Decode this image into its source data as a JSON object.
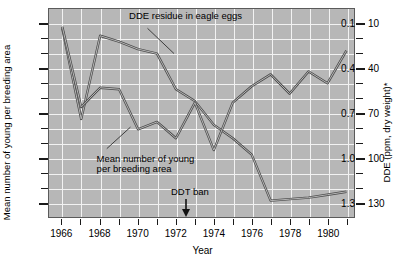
{
  "chart_data": {
    "type": "line",
    "title": "",
    "xlabel": "Year",
    "ylabel_left": "Mean number of young per breeding area",
    "ylabel_right": "DDE (ppm, dry weight)*",
    "x": [
      1966,
      1967,
      1968,
      1969,
      1970,
      1971,
      1972,
      1973,
      1974,
      1975,
      1976,
      1977,
      1978,
      1979,
      1980,
      1981
    ],
    "xlim": [
      1965.3,
      1981.4
    ],
    "xticks_major": [
      1966,
      1968,
      1970,
      1972,
      1974,
      1976,
      1978,
      1980
    ],
    "xticks_all": [
      1966,
      1967,
      1968,
      1969,
      1970,
      1971,
      1972,
      1973,
      1974,
      1975,
      1976,
      1977,
      1978,
      1979,
      1980,
      1981
    ],
    "ylim_left": [
      0.0,
      1.4
    ],
    "yticks_left_major": [
      0.1,
      0.4,
      0.7,
      1.0,
      1.3
    ],
    "yticks_left_minor": [
      0.2,
      0.3,
      0.5,
      0.6,
      0.8,
      0.9,
      1.1,
      1.2
    ],
    "ylim_right": [
      0,
      140
    ],
    "yticks_right_major": [
      10,
      40,
      70,
      100,
      130
    ],
    "yticks_right_minor": [
      20,
      30,
      50,
      60,
      80,
      90,
      110,
      120
    ],
    "grid": true,
    "legend": "none",
    "series": [
      {
        "name": "DDE residue in eagle eggs",
        "axis": "right",
        "unit": "ppm, dry weight",
        "values": [
          127,
          66,
          122,
          118,
          113,
          110,
          86,
          78,
          62,
          53,
          42,
          11,
          12,
          13,
          15,
          17
        ]
      },
      {
        "name": "Mean number of young per breeding area",
        "axis": "left",
        "unit": "young per breeding area",
        "values": [
          1.28,
          0.74,
          0.87,
          0.86,
          0.59,
          0.64,
          0.53,
          0.77,
          0.45,
          0.77,
          0.88,
          0.96,
          0.83,
          0.98,
          0.9,
          1.12
        ]
      }
    ],
    "annotations": [
      {
        "text": "DDE residue in eagle eggs",
        "x": 1969.6,
        "y_left": 1.33
      },
      {
        "text": "Mean number of young",
        "x": 1967.9,
        "y_left": 0.4
      },
      {
        "text": "per breeding area",
        "x": 1967.9,
        "y_left": 0.33
      },
      {
        "text": "DDT ban",
        "x": 1972.6,
        "y_left": 0.17,
        "marker": "down-arrow",
        "marker_x": 1972.55
      }
    ],
    "colors": {
      "plot_background": "#b7b7b7",
      "gridline": "#f2f2f2",
      "line_dde": "#4a4a4a",
      "line_young": "#4a4a4a",
      "axis": "#1a1a1a",
      "page_background": "#ffffff"
    }
  },
  "axes": {
    "left": {
      "labels": [
        "1.3",
        "1.0",
        "0.7",
        "0.4",
        "0.1"
      ],
      "title": "Mean number of young per breeding area"
    },
    "right": {
      "labels": [
        "130",
        "100",
        "70",
        "40",
        "10"
      ],
      "title": "DDE (ppm, dry weight)*"
    },
    "bottom": {
      "labels": [
        "1966",
        "1968",
        "1970",
        "1972",
        "1974",
        "1976",
        "1978",
        "1980"
      ],
      "title": "Year"
    }
  },
  "annotations": {
    "dde_label": "DDE residue in eagle eggs",
    "young_label_line1": "Mean number of young",
    "young_label_line2": "per breeding area",
    "ddt_ban_label": "DDT ban"
  }
}
